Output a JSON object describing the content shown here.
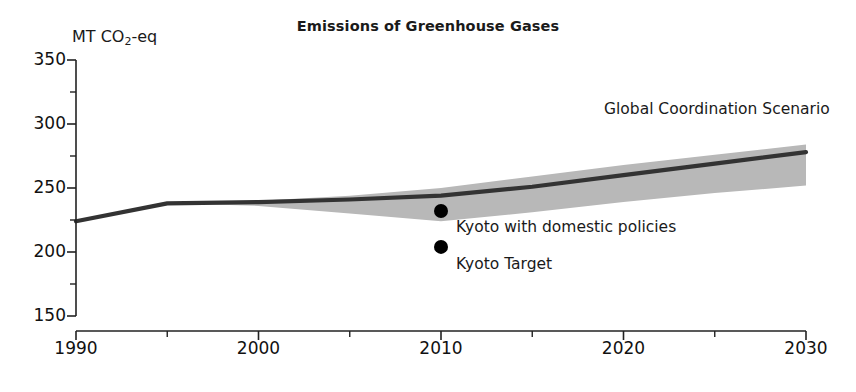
{
  "chart_data": {
    "type": "area",
    "title": "Emissions of Greenhouse Gases",
    "ylabel": "MT CO2-eq",
    "ylabel_prefix": "MT CO",
    "ylabel_sub": "2",
    "ylabel_suffix": "-eq",
    "xlabel": "",
    "xlim": [
      1990,
      2030
    ],
    "ylim": [
      150,
      350
    ],
    "grid": false,
    "legend_position": "inline-annotation",
    "y_ticks_major": [
      150,
      200,
      250,
      300,
      350
    ],
    "y_ticks_minor": [
      175,
      225,
      275,
      325
    ],
    "x_ticks_major": [
      1990,
      2000,
      2010,
      2020,
      2030
    ],
    "x_ticks_minor": [
      1995,
      2005,
      2015,
      2025
    ],
    "colors": {
      "band": "#b8b8b8",
      "line": "#333333",
      "axis": "#222222",
      "text": "#1a1a1a",
      "point": "#000000"
    },
    "series": [
      {
        "name": "Global Coordination Scenario",
        "type": "line",
        "x": [
          1990,
          1995,
          2000,
          2005,
          2010,
          2015,
          2020,
          2025,
          2030
        ],
        "values": [
          224,
          238,
          239,
          241,
          244,
          251,
          260,
          269,
          278
        ]
      },
      {
        "name": "Global Coordination Scenario range",
        "type": "band",
        "x": [
          1995,
          2000,
          2005,
          2010,
          2015,
          2020,
          2025,
          2030
        ],
        "upper": [
          238,
          240,
          244,
          250,
          259,
          268,
          276,
          284
        ],
        "lower": [
          238,
          236,
          230,
          224,
          231,
          239,
          246,
          252
        ]
      }
    ],
    "annotations": [
      {
        "name": "global-coordination-scenario",
        "text": "Global Coordination Scenario",
        "x_px": 604,
        "y_px": 100
      }
    ],
    "points": [
      {
        "name": "kyoto-with-domestic-policies",
        "label": "Kyoto with domestic policies",
        "x": 2010,
        "value": 232,
        "label_x_px": 456,
        "label_y_px": 218
      },
      {
        "name": "kyoto-target",
        "label": "Kyoto Target",
        "x": 2010,
        "value": 204,
        "label_x_px": 456,
        "label_y_px": 255
      }
    ]
  }
}
